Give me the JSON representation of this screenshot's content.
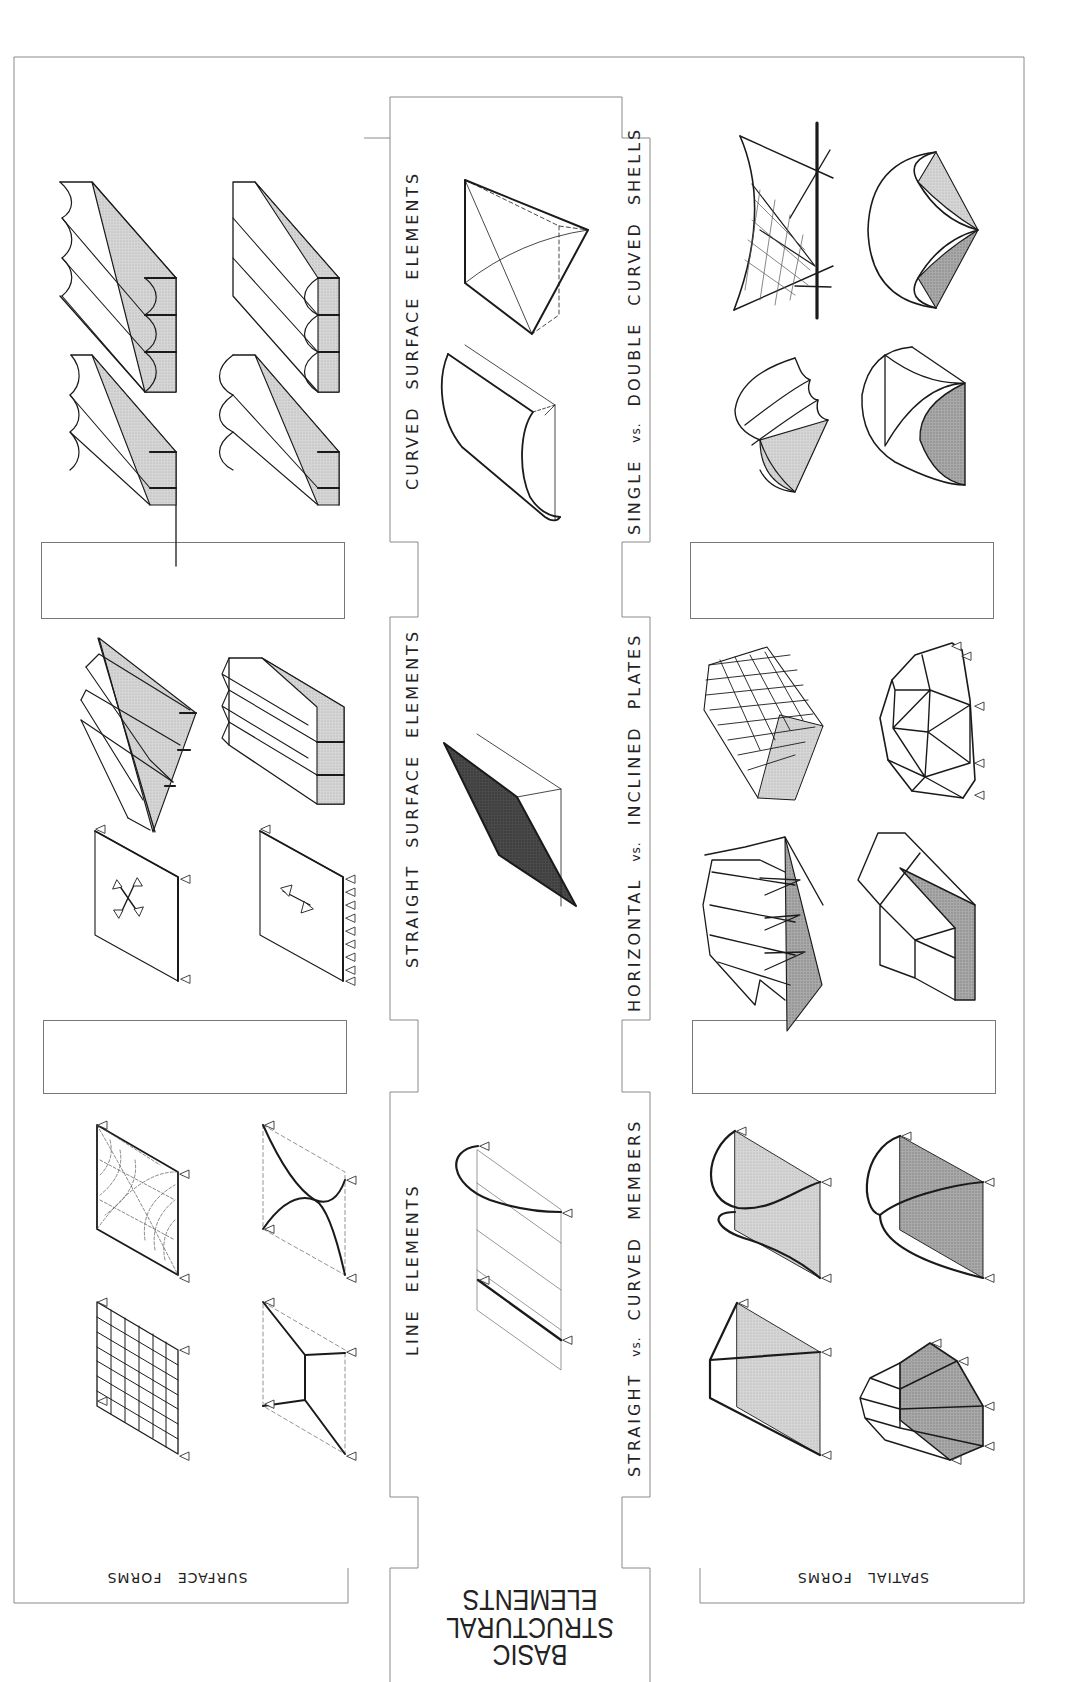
{
  "plate": {
    "title_lines": [
      "BASIC",
      "STRUCTURAL",
      "ELEMENTS"
    ],
    "title_orientation": "rotated-180"
  },
  "panels": {
    "surface_forms": {
      "label": "SURFACE FORMS",
      "orientation": "rotated-180"
    },
    "spatial_forms": {
      "label": "SPATIAL FORMS",
      "orientation": "rotated-180"
    }
  },
  "center_column": {
    "sections": [
      {
        "label": "CURVED SURFACE ELEMENTS",
        "orientation": "rotated-90"
      },
      {
        "label": "STRAIGHT SURFACE ELEMENTS",
        "orientation": "rotated-90"
      },
      {
        "label": "LINE ELEMENTS",
        "orientation": "rotated-90"
      }
    ]
  },
  "comparison_labels": [
    {
      "before": "SINGLE",
      "vs": "vs.",
      "after": "DOUBLE CURVED SHELLS"
    },
    {
      "before": "HORIZONTAL",
      "vs": "vs.",
      "after": "INCLINED PLATES"
    },
    {
      "before": "STRAIGHT",
      "vs": "vs.",
      "after": "CURVED MEMBERS"
    }
  ],
  "caption_boxes": [
    {
      "id": "left-upper",
      "text": ""
    },
    {
      "id": "left-lower",
      "text": ""
    },
    {
      "id": "right-upper",
      "text": ""
    },
    {
      "id": "right-lower",
      "text": ""
    }
  ],
  "drawings": {
    "surface_forms": [
      "barrel-vault-series-scalloped",
      "barrel-vault-series-round",
      "cylindrical-shell-series-a",
      "cylindrical-shell-series-b",
      "folded-plate-inclined",
      "folded-plate-horizontal",
      "plate-two-way-span",
      "plate-one-way-span",
      "grid-slab",
      "stress-trajectory-slab",
      "cable-net-curved",
      "cable-net-straight"
    ],
    "center": [
      "hyperbolic-paraboloid-element",
      "cylindrical-shell-element",
      "flat-plate-element",
      "curved-and-straight-line-members"
    ],
    "spatial_forms": [
      "hypar-with-generators",
      "dome-quadrant-shell",
      "multi-vault-shell",
      "intersecting-vault-shell",
      "folded-plate-accordion",
      "geodesic-dome",
      "folded-plate-pyramidal",
      "faceted-vault",
      "arch-curved-members-a",
      "arch-curved-members-b",
      "truss-straight-members",
      "polygonal-frame-straight-members"
    ]
  },
  "colors": {
    "line": "#1a1a1a",
    "frame": "#8a8a8a",
    "shade_light": "#d4d4d4",
    "shade_mid": "#bdbdbd",
    "shade_dark": "#5a5a5a",
    "paper": "#ffffff"
  }
}
